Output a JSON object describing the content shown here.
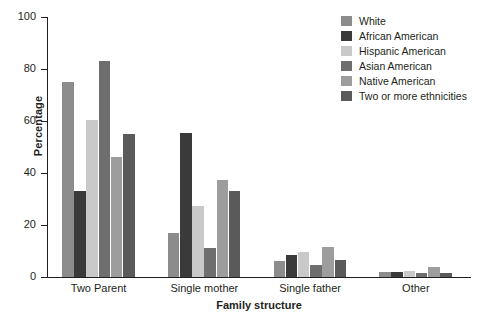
{
  "chart_data": {
    "type": "bar",
    "title": "",
    "xlabel": "Family structure",
    "ylabel": "Percentage",
    "categories": [
      "Two Parent",
      "Single mother",
      "Single father",
      "Other"
    ],
    "ylim": [
      0,
      100
    ],
    "yticks": [
      0,
      20,
      40,
      60,
      80,
      100
    ],
    "grid": false,
    "legend_position": "top-right",
    "series": [
      {
        "name": "White",
        "color": "#8c8c8c",
        "values": [
          75,
          17,
          6,
          2
        ]
      },
      {
        "name": "African American",
        "color": "#3a3a3a",
        "values": [
          33,
          55.5,
          8.5,
          2
        ]
      },
      {
        "name": "Hispanic American",
        "color": "#c9c9c9",
        "values": [
          60.5,
          27.5,
          9.5,
          2.5
        ]
      },
      {
        "name": "Asian American",
        "color": "#6e6e6e",
        "values": [
          83,
          11,
          4.5,
          1.5
        ]
      },
      {
        "name": "Native American",
        "color": "#9d9d9d",
        "values": [
          46,
          37.5,
          11.5,
          4
        ]
      },
      {
        "name": "Two or more ethnicities",
        "color": "#5a5a5a",
        "values": [
          55,
          33,
          6.5,
          1.5
        ]
      }
    ]
  },
  "legend": {
    "items": [
      {
        "label": "White"
      },
      {
        "label": "African American"
      },
      {
        "label": "Hispanic American"
      },
      {
        "label": "Asian American"
      },
      {
        "label": "Native American"
      },
      {
        "label": "Two or more ethnicities"
      }
    ]
  },
  "axes": {
    "y_label": "Percentage",
    "x_label": "Family structure",
    "y_ticks": [
      "0",
      "20",
      "40",
      "60",
      "80",
      "100"
    ],
    "x_ticks": [
      "Two Parent",
      "Single mother",
      "Single father",
      "Other"
    ]
  }
}
